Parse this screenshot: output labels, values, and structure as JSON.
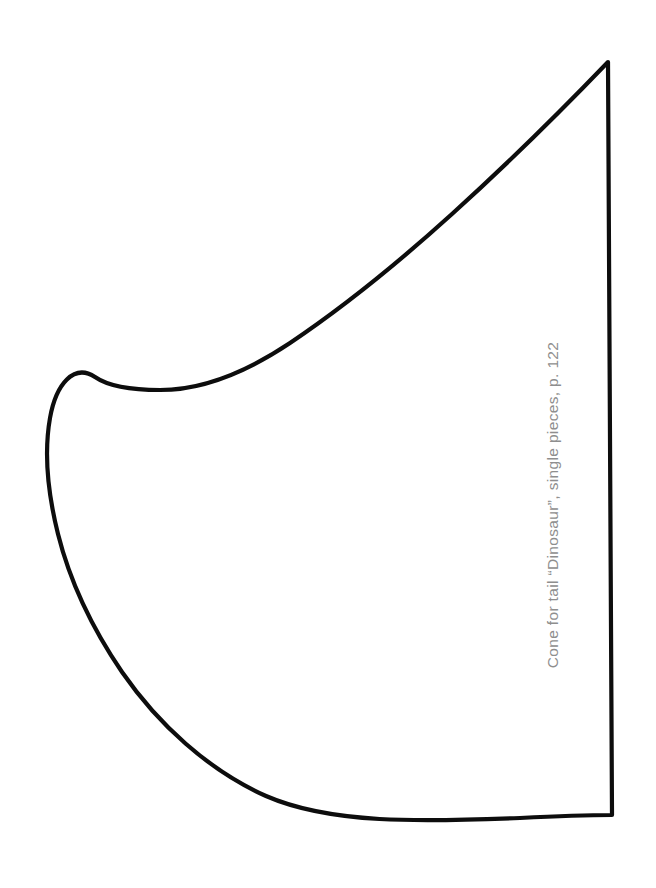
{
  "page": {
    "width": 656,
    "height": 888,
    "background_color": "#ffffff"
  },
  "caption": {
    "text": "Cone for tail “Dinosaur”, single pieces, p. 122",
    "color": "#8e8e8e",
    "orientation": "rotated-90-ccw",
    "page_reference": "p. 122",
    "project_name": "Dinosaur",
    "part_name": "Cone for tail",
    "piece_note": "single pieces"
  },
  "pattern_shape": {
    "name": "cone-tail-pattern-outline",
    "stroke_color": "#0d0d0d",
    "fill_color": "none",
    "stroke_width": 4.2,
    "apex_point": "608,62",
    "leftmost_point": "47,455",
    "bottom_right_corner": "612,815",
    "shoulder_point": "92,377",
    "path": "M 608 62 C 560 112 505 166 452 214 C 399 262 345 306 290 343 C 245 373 200 390 160 390 C 130 390 108 386 95 377 C 74 363 56 384 50 418 C 44 452 48 494 58 534 C 70 582 92 628 122 672 C 158 724 208 770 266 796 C 330 824 420 822 520 818 C 558 816 590 815 612 815 L 608 62 Z"
  }
}
